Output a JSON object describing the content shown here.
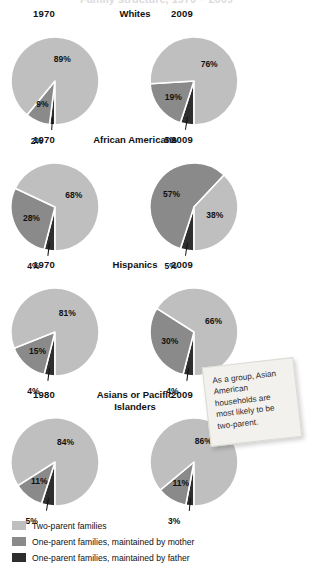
{
  "title_clipped": "Family structure, 1970 – 2009",
  "chart_data": {
    "type": "pie",
    "legend_position": "bottom-left",
    "categories": [
      "Two-parent families",
      "One-parent families, maintained by mother",
      "One-parent families, maintained by father"
    ],
    "colors": {
      "two_parent": "#bfbfbf",
      "mother": "#8a8a8a",
      "father": "#2e2e2e",
      "slice_border": "#ffffff",
      "text": "#111111"
    },
    "groups": [
      {
        "name": "Whites",
        "charts": [
          {
            "year": "1970",
            "slices": [
              {
                "key": "two_parent",
                "label": "89%",
                "value": 89
              },
              {
                "key": "mother",
                "label": "9%",
                "value": 9
              },
              {
                "key": "father",
                "label": "2%",
                "value": 2
              }
            ]
          },
          {
            "year": "2009",
            "slices": [
              {
                "key": "two_parent",
                "label": "76%",
                "value": 76
              },
              {
                "key": "mother",
                "label": "19%",
                "value": 19
              },
              {
                "key": "father",
                "label": "5%",
                "value": 5
              }
            ]
          }
        ]
      },
      {
        "name": "African Americans",
        "charts": [
          {
            "year": "1970",
            "slices": [
              {
                "key": "two_parent",
                "label": "68%",
                "value": 68
              },
              {
                "key": "mother",
                "label": "28%",
                "value": 28
              },
              {
                "key": "father",
                "label": "4%",
                "value": 4
              }
            ]
          },
          {
            "year": "2009",
            "slices": [
              {
                "key": "two_parent",
                "label": "38%",
                "value": 38
              },
              {
                "key": "mother",
                "label": "57%",
                "value": 57
              },
              {
                "key": "father",
                "label": "5%",
                "value": 5
              }
            ]
          }
        ]
      },
      {
        "name": "Hispanics",
        "charts": [
          {
            "year": "1970",
            "slices": [
              {
                "key": "two_parent",
                "label": "81%",
                "value": 81
              },
              {
                "key": "mother",
                "label": "15%",
                "value": 15
              },
              {
                "key": "father",
                "label": "4%",
                "value": 4
              }
            ]
          },
          {
            "year": "2009",
            "slices": [
              {
                "key": "two_parent",
                "label": "66%",
                "value": 66
              },
              {
                "key": "mother",
                "label": "30%",
                "value": 30
              },
              {
                "key": "father",
                "label": "4%",
                "value": 4
              }
            ]
          }
        ]
      },
      {
        "name": "Asians or Pacific Islanders",
        "charts": [
          {
            "year": "1980",
            "slices": [
              {
                "key": "two_parent",
                "label": "84%",
                "value": 84
              },
              {
                "key": "mother",
                "label": "11%",
                "value": 11
              },
              {
                "key": "father",
                "label": "5%",
                "value": 5
              }
            ]
          },
          {
            "year": "2009",
            "slices": [
              {
                "key": "two_parent",
                "label": "86%",
                "value": 86
              },
              {
                "key": "mother",
                "label": "11%",
                "value": 11
              },
              {
                "key": "father",
                "label": "3%",
                "value": 3
              }
            ]
          }
        ]
      }
    ]
  },
  "callout": {
    "text": "As a group, Asian American households are most likely to be two-parent."
  }
}
